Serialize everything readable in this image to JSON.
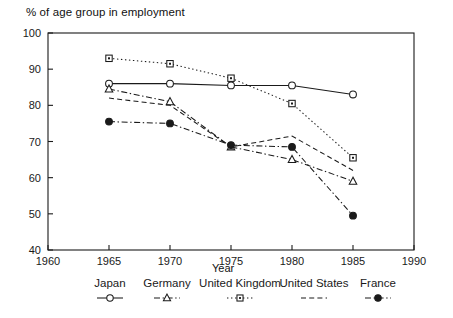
{
  "chart_data": {
    "type": "line",
    "title": "",
    "ylabel": "% of age group in employment",
    "xlabel": "Year",
    "x": [
      1965,
      1970,
      1975,
      1980,
      1985
    ],
    "xlim": [
      1960,
      1990
    ],
    "ylim": [
      40,
      100
    ],
    "xticks": [
      1960,
      1965,
      1970,
      1975,
      1980,
      1985,
      1990
    ],
    "yticks": [
      40,
      50,
      60,
      70,
      80,
      90,
      100
    ],
    "grid": false,
    "legend_position": "bottom",
    "series": [
      {
        "name": "Japan",
        "marker": "open-circle",
        "linestyle": "solid",
        "values": [
          86.0,
          86.0,
          85.5,
          85.5,
          83.0
        ]
      },
      {
        "name": "Germany",
        "marker": "open-triangle",
        "linestyle": "dash-dot",
        "values": [
          84.5,
          81.0,
          68.5,
          65.0,
          59.0
        ]
      },
      {
        "name": "United Kingdom",
        "marker": "open-square",
        "linestyle": "dotted",
        "values": [
          93.0,
          91.5,
          87.5,
          80.5,
          65.5
        ]
      },
      {
        "name": "United States",
        "marker": "none",
        "linestyle": "dashed",
        "values": [
          82.0,
          80.0,
          68.5,
          71.5,
          62.0
        ]
      },
      {
        "name": "France",
        "marker": "filled-circle",
        "linestyle": "dash-dot",
        "values": [
          75.5,
          75.0,
          69.0,
          68.5,
          49.5
        ]
      }
    ]
  },
  "axis": {
    "ylabel_text": "% of age group in employment",
    "xlabel_text": "Year",
    "yticks": [
      "100",
      "90",
      "80",
      "70",
      "60",
      "50",
      "40"
    ],
    "xticks": [
      "1960",
      "1965",
      "1970",
      "1975",
      "1980",
      "1985",
      "1990"
    ]
  },
  "legend": {
    "entries": [
      {
        "label": "Japan"
      },
      {
        "label": "Germany"
      },
      {
        "label": "United Kingdom"
      },
      {
        "label": "United States"
      },
      {
        "label": "France"
      }
    ]
  },
  "colors": {
    "ink": "#1a1a1a",
    "background": "#ffffff"
  }
}
